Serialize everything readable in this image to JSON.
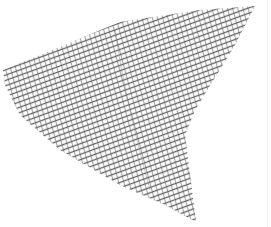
{
  "image": {
    "subject": "crosshatched mesh fragment",
    "background_color": "#ffffff",
    "ink_color": "#555555",
    "shape_outline": [
      [
        3,
        70
      ],
      [
        40,
        55
      ],
      [
        120,
        22
      ],
      [
        200,
        10
      ],
      [
        255,
        6
      ],
      [
        235,
        45
      ],
      [
        195,
        110
      ],
      [
        185,
        135
      ],
      [
        192,
        190
      ],
      [
        196,
        222
      ],
      [
        165,
        205
      ],
      [
        120,
        185
      ],
      [
        60,
        150
      ],
      [
        20,
        115
      ],
      [
        5,
        85
      ]
    ],
    "hatch": {
      "primary_angle_deg": -20,
      "secondary_angle_deg": 75,
      "spacing_px": 5,
      "stroke_width_px": 1.2
    }
  }
}
